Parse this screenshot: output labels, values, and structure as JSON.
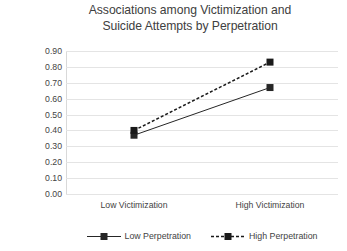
{
  "chart_data": {
    "type": "line",
    "title": "Associations among Victimization and Suicide Attempts by Perpetration",
    "title_lines": [
      "Associations among Victimization and",
      "Suicide Attempts by Perpetration"
    ],
    "xlabel": "",
    "ylabel": "Suicide Attemps",
    "categories": [
      "Low Victimization",
      "High Victimization"
    ],
    "series": [
      {
        "name": "Low Perpetration",
        "values": [
          0.37,
          0.67
        ],
        "line_style": "solid",
        "marker": "square",
        "color": "#262626"
      },
      {
        "name": "High Perpetration",
        "values": [
          0.4,
          0.83
        ],
        "line_style": "dashed",
        "marker": "square",
        "color": "#1a1a1a"
      }
    ],
    "ylim": [
      0.0,
      0.9
    ],
    "ytick_step": 0.1,
    "ytick_labels": [
      "0.90",
      "0.80",
      "0.70",
      "0.60",
      "0.50",
      "0.40",
      "0.30",
      "0.20",
      "0.10",
      "0.00"
    ],
    "grid": "horizontal",
    "legend_position": "bottom",
    "background_color": "#ffffff",
    "gridline_color": "#e4e4e4",
    "text_color": "#434343"
  },
  "legend": {
    "items": [
      {
        "label": "Low Perpetration"
      },
      {
        "label": "High Perpetration"
      }
    ]
  }
}
